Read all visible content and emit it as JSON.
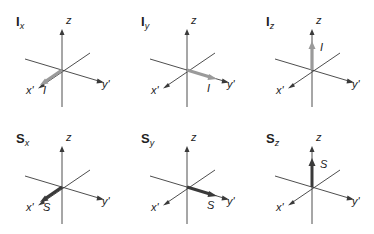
{
  "colors": {
    "axis": "#3a3a3a",
    "nuclear_spin_arrow": "#9a9a9a",
    "electron_spin_arrow": "#3a3a3a",
    "text": "#222222"
  },
  "panels": [
    {
      "id": "Ix",
      "title_main": "I",
      "title_sub": "x",
      "vector_label": "I",
      "direction": "x",
      "axis_labels": {
        "z": "z",
        "x": "x'",
        "y": "y'"
      }
    },
    {
      "id": "Iy",
      "title_main": "I",
      "title_sub": "y",
      "vector_label": "I",
      "direction": "y",
      "axis_labels": {
        "z": "z",
        "x": "x'",
        "y": "y'"
      }
    },
    {
      "id": "Iz",
      "title_main": "I",
      "title_sub": "z",
      "vector_label": "I",
      "direction": "z",
      "axis_labels": {
        "z": "z",
        "x": "x'",
        "y": "y'"
      }
    },
    {
      "id": "Sx",
      "title_main": "S",
      "title_sub": "x",
      "vector_label": "S",
      "direction": "x",
      "axis_labels": {
        "z": "z",
        "x": "x'",
        "y": "y'"
      }
    },
    {
      "id": "Sy",
      "title_main": "S",
      "title_sub": "y",
      "vector_label": "S",
      "direction": "y",
      "axis_labels": {
        "z": "z",
        "x": "x'",
        "y": "y'"
      }
    },
    {
      "id": "Sz",
      "title_main": "S",
      "title_sub": "z",
      "vector_label": "S",
      "direction": "z",
      "axis_labels": {
        "z": "z",
        "x": "x'",
        "y": "y'"
      }
    }
  ]
}
